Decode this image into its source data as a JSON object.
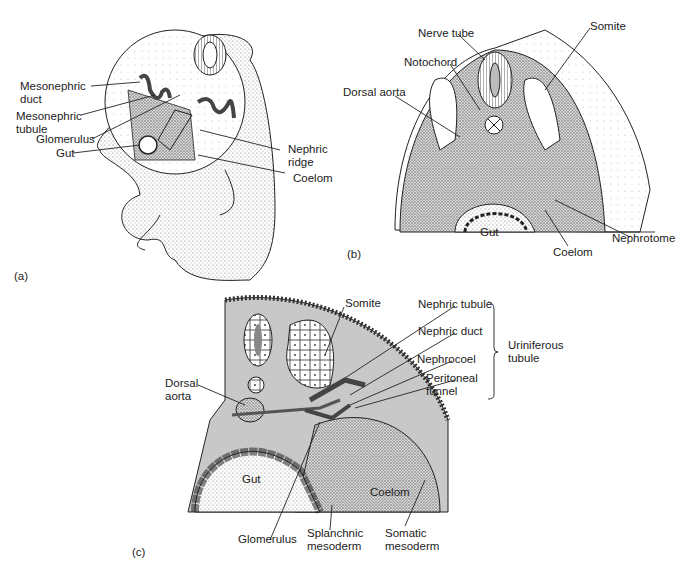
{
  "figure": {
    "panels": [
      {
        "id": "a",
        "label": "(a)",
        "labels": {
          "mesonephric_duct": [
            "Mesonephric",
            "duct"
          ],
          "mesonephric_tubule": [
            "Mesonephric",
            "tubule"
          ],
          "glomerulus": "Glomerulus",
          "gut": "Gut",
          "nephric_ridge": [
            "Nephric",
            "ridge"
          ],
          "coelom": "Coelom"
        }
      },
      {
        "id": "b",
        "label": "(b)",
        "labels": {
          "nerve_tube": "Nerve tube",
          "notochord": "Notochord",
          "dorsal_aorta": "Dorsal aorta",
          "somite": "Somite",
          "gut": "Gut",
          "coelom": "Coelom",
          "nephrotome": "Nephrotome"
        }
      },
      {
        "id": "c",
        "label": "(c)",
        "labels": {
          "somite": "Somite",
          "nephric_tubule": "Nephric tubule",
          "nephric_duct": "Nephric duct",
          "nephrocoel": "Nephrocoel",
          "peritoneal_funnel": [
            "Peritoneal",
            "funnel"
          ],
          "uriniferous_tubule": [
            "Uriniferous",
            "tubule"
          ],
          "dorsal_aorta": [
            "Dorsal",
            "aorta"
          ],
          "gut": "Gut",
          "coelom": "Coelom",
          "glomerulus": "Glomerulus",
          "splanchnic_mesoderm": [
            "Splanchnic",
            "mesoderm"
          ],
          "somatic_mesoderm": [
            "Somatic",
            "mesoderm"
          ]
        }
      }
    ],
    "colors": {
      "line": "#222222",
      "tissue_gray": "#c8c8c8",
      "stipple": "#9a9a9a"
    }
  }
}
